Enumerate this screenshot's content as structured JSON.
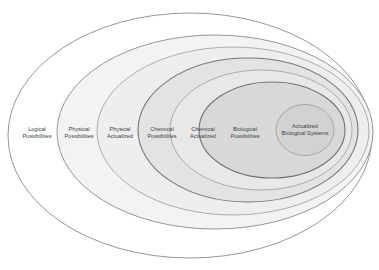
{
  "diagram": {
    "type": "nested-venn-ellipses",
    "background_color": "#ffffff",
    "canvas": {
      "width": 379,
      "height": 270
    },
    "bands": [
      {
        "id": "logical-possibilities",
        "label_line1": "Logical",
        "label_line2": "Possibilities",
        "level": 1,
        "fill_color": "#ffffff",
        "stroke_color": "#8a8a90",
        "label_x": 37,
        "label_y": 131,
        "cx": 190.0,
        "cy": 135.5,
        "rx": 182.0,
        "ry": 122.5
      },
      {
        "id": "physical-possibilities",
        "label_line1": "Physical",
        "label_line2": "Possibilities",
        "level": 2,
        "fill_color": "#f3f3f3",
        "stroke_color": "#8a8a90",
        "label_x": 79,
        "label_y": 131,
        "cx": 215.0,
        "cy": 132.0,
        "rx": 158.0,
        "ry": 97.0
      },
      {
        "id": "physical-actualized",
        "label_line1": "Physical",
        "label_line2": "Actualized",
        "level": 3,
        "fill_color": "#eeeeee",
        "stroke_color": "#9a9aa0",
        "label_x": 120,
        "label_y": 131,
        "cx": 233.0,
        "cy": 131.0,
        "rx": 136.0,
        "ry": 84.0
      },
      {
        "id": "chemical-possibilities",
        "label_line1": "Chemical",
        "label_line2": "Possibilities",
        "level": 4,
        "fill_color": "#e3e3e3",
        "stroke_color": "#76767c",
        "label_x": 162,
        "label_y": 131,
        "cx": 248.0,
        "cy": 130.0,
        "rx": 110.0,
        "ry": 72.0
      },
      {
        "id": "chemical-actualized",
        "label_line1": "Chemical",
        "label_line2": "Actualized",
        "level": 5,
        "fill_color": "#e8e8e8",
        "stroke_color": "#9a9aa0",
        "label_x": 203,
        "label_y": 131,
        "cx": 261.0,
        "cy": 130.0,
        "rx": 91.0,
        "ry": 60.0
      },
      {
        "id": "biological-possibilities",
        "label_line1": "Biological",
        "label_line2": "Possibilities",
        "level": 6,
        "fill_color": "#d8d8d8",
        "stroke_color": "#70707a",
        "label_x": 245,
        "label_y": 131,
        "cx": 272.0,
        "cy": 130.0,
        "rx": 73.0,
        "ry": 48.0
      },
      {
        "id": "actualized-biological-systems",
        "label_line1": "Actualized",
        "label_line2": "Biological Systems",
        "level": 7,
        "fill_color": "#d2d2d2",
        "stroke_color": "#9a9aa0",
        "label_x": 305,
        "label_y": 128,
        "cx": 305.0,
        "cy": 130.0,
        "rx": 29.0,
        "ry": 25.5
      }
    ]
  }
}
